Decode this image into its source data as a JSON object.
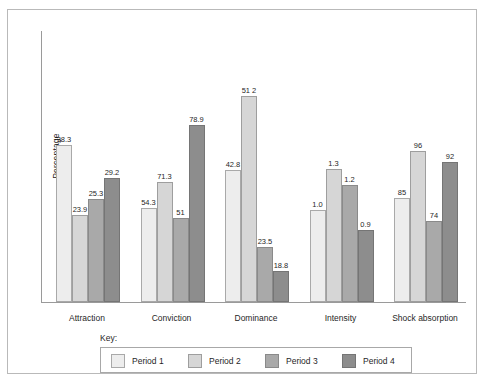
{
  "chart_data": {
    "type": "bar",
    "title": "",
    "subtitle": "",
    "xlabel": "",
    "ylabel": "Percentage",
    "grid": false,
    "legend_position": "bottom",
    "legend_title": "Key:",
    "axis_ticks_shown": false,
    "categories": [
      "Attraction",
      "Conviction",
      "Dominance",
      "Intensity",
      "Shock absorption"
    ],
    "series": [
      {
        "name": "Period 1",
        "color": "#ededed",
        "values": [
          38.3,
          54.3,
          42.8,
          1.0,
          85
        ],
        "labels": [
          "38.3",
          "54.3",
          "42.8",
          "1.0",
          "85"
        ],
        "bar_px_heights": [
          157,
          94,
          132,
          92,
          104
        ]
      },
      {
        "name": "Period 2",
        "color": "#d6d6d6",
        "values": [
          23.9,
          71.3,
          57.1,
          1.3,
          96
        ],
        "labels": [
          "23.9",
          "71.3",
          "51 2",
          "1.3",
          "96"
        ],
        "bar_px_heights": [
          87,
          120,
          206,
          133,
          151
        ]
      },
      {
        "name": "Period 3",
        "color": "#a9a9a9",
        "values": [
          25.3,
          51,
          23.5,
          1.2,
          74
        ],
        "labels": [
          "25.3",
          "51",
          "23.5",
          "1.2",
          "74"
        ],
        "bar_px_heights": [
          103,
          84,
          55,
          117,
          81
        ]
      },
      {
        "name": "Period 4",
        "color": "#8d8d8d",
        "values": [
          29.2,
          78.9,
          18.8,
          0.9,
          92
        ],
        "labels": [
          "29.2",
          "78.9",
          "18.8",
          "0.9",
          "92"
        ],
        "bar_px_heights": [
          124,
          177,
          31,
          72,
          140
        ]
      }
    ]
  },
  "legend": {
    "title": "Key:",
    "items": [
      {
        "label": "Period 1",
        "color": "#ededed"
      },
      {
        "label": "Period 2",
        "color": "#d6d6d6"
      },
      {
        "label": "Period 3",
        "color": "#a9a9a9"
      },
      {
        "label": "Period 4",
        "color": "#8d8d8d"
      }
    ]
  }
}
